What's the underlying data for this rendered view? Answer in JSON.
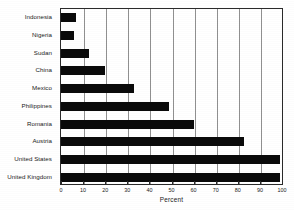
{
  "chart_data": {
    "type": "bar",
    "orientation": "horizontal",
    "title": "",
    "xlabel": "Percent",
    "ylabel": "",
    "xlim": [
      0,
      100
    ],
    "ylim": null,
    "grid": true,
    "legend": null,
    "xticks": [
      0,
      10,
      20,
      30,
      40,
      50,
      60,
      70,
      80,
      90,
      100
    ],
    "xticklabels": [
      "0",
      "10",
      "20",
      "30",
      "40",
      "50",
      "60",
      "70",
      "80",
      "90",
      "100"
    ],
    "categories": [
      "Indonesia",
      "Nigeria",
      "Sudan",
      "China",
      "Mexico",
      "Philippines",
      "Romania",
      "Austria",
      "United States",
      "United Kingdom"
    ],
    "values": [
      7,
      6,
      12.5,
      20,
      33,
      49,
      60,
      83,
      99,
      99
    ],
    "bar_color": "#0a0a0a"
  }
}
